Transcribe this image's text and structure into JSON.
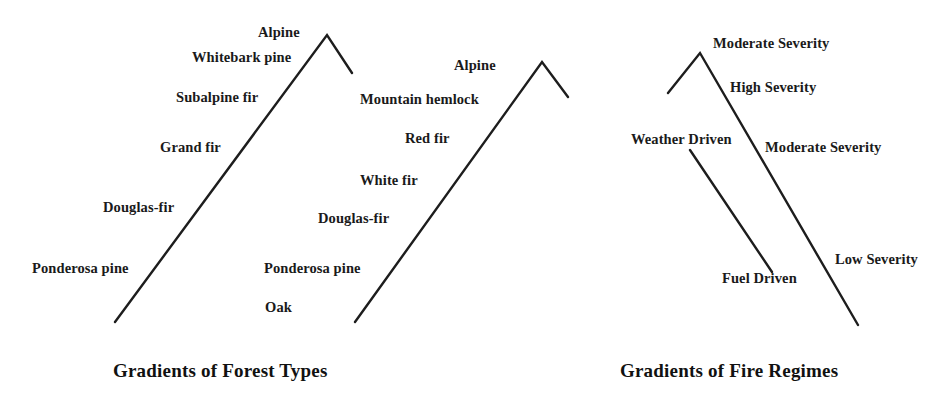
{
  "figure": {
    "background_color": "#ffffff",
    "line_color": "#1d1d1d",
    "text_color": "#1a1a1a"
  },
  "panels": [
    {
      "id": "forest-types",
      "caption": "Gradients of Forest Types",
      "caption_x": 113,
      "caption_y": 360,
      "peaks": [
        {
          "name": "inland-mountain",
          "points": "115,322 327,35 352,73"
        },
        {
          "name": "coastal-mountain",
          "points": "355,322 542,62 568,97"
        }
      ],
      "labels": [
        {
          "text": "Alpine",
          "x": 258,
          "y": 24,
          "group": "inland"
        },
        {
          "text": "Whitebark pine",
          "x": 192,
          "y": 49,
          "group": "inland"
        },
        {
          "text": "Subalpine fir",
          "x": 176,
          "y": 89,
          "group": "inland"
        },
        {
          "text": "Grand fir",
          "x": 160,
          "y": 139,
          "group": "inland"
        },
        {
          "text": "Douglas-fir",
          "x": 103,
          "y": 199,
          "group": "inland"
        },
        {
          "text": "Ponderosa pine",
          "x": 32,
          "y": 260,
          "group": "inland"
        },
        {
          "text": "Alpine",
          "x": 454,
          "y": 57,
          "group": "coastal"
        },
        {
          "text": "Mountain hemlock",
          "x": 360,
          "y": 91,
          "group": "coastal"
        },
        {
          "text": "Red fir",
          "x": 405,
          "y": 130,
          "group": "coastal"
        },
        {
          "text": "White fir",
          "x": 360,
          "y": 172,
          "group": "coastal"
        },
        {
          "text": "Douglas-fir",
          "x": 318,
          "y": 210,
          "group": "coastal"
        },
        {
          "text": "Ponderosa pine",
          "x": 264,
          "y": 260,
          "group": "coastal"
        },
        {
          "text": "Oak",
          "x": 265,
          "y": 299,
          "group": "coastal"
        }
      ]
    },
    {
      "id": "fire-regimes",
      "caption": "Gradients of Fire Regimes",
      "caption_x": 620,
      "caption_y": 360,
      "peaks": [
        {
          "name": "severity-ridge",
          "points": "668,93 700,53 858,325"
        },
        {
          "name": "driver-line",
          "points": "690,150 772,272"
        }
      ],
      "labels": [
        {
          "text": "Moderate Severity",
          "x": 713,
          "y": 35,
          "group": "severity"
        },
        {
          "text": "High Severity",
          "x": 730,
          "y": 79,
          "group": "severity"
        },
        {
          "text": "Weather Driven",
          "x": 631,
          "y": 131,
          "group": "driver"
        },
        {
          "text": "Moderate Severity",
          "x": 765,
          "y": 139,
          "group": "severity"
        },
        {
          "text": "Low Severity",
          "x": 835,
          "y": 251,
          "group": "severity"
        },
        {
          "text": "Fuel Driven",
          "x": 722,
          "y": 270,
          "group": "driver"
        }
      ]
    }
  ]
}
